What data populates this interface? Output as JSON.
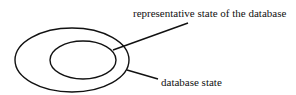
{
  "diagram": {
    "labels": {
      "inner": "representative state of the database",
      "outer": "database state"
    },
    "colors": {
      "stroke": "#111111",
      "background": "#ffffff"
    }
  }
}
